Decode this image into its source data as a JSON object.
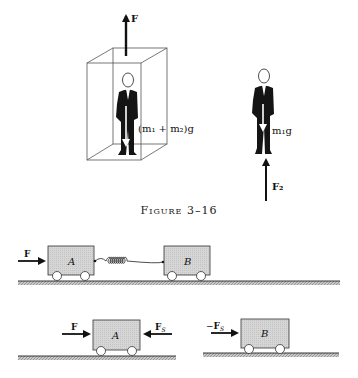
{
  "figure": {
    "caption": "Figure 3–16",
    "elevator_panel": {
      "force_up_label": "F",
      "weight_label": "(m₁ + m₂)g"
    },
    "person_panel": {
      "weight_label": "m₁g",
      "normal_force_label": "F₂"
    }
  },
  "carts_system": {
    "force_label": "F",
    "cart_a_label": "A",
    "cart_b_label": "B",
    "connector": "spring"
  },
  "carts_free_body": {
    "cart_a": {
      "label": "A",
      "left_force": "F",
      "right_force": "F",
      "right_force_sub": "S"
    },
    "cart_b": {
      "label": "B",
      "left_force_prefix": "−",
      "left_force": "F",
      "left_force_sub": "S"
    }
  },
  "colors": {
    "cart_fill": "#d4d4d4",
    "ground_hatch": "#9a9a9a",
    "ink": "#111111",
    "suit": "#141414"
  }
}
